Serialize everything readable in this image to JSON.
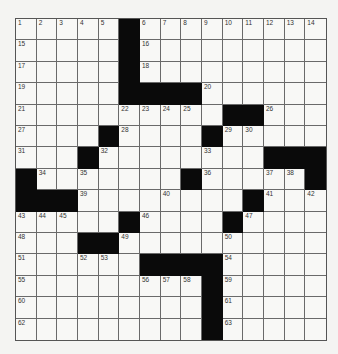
{
  "puzzle": {
    "rows": 15,
    "cols": 15,
    "colors": {
      "block": "#0a0a0a",
      "cell": "#f8f8f6",
      "line": "#6a6a6a",
      "background": "#f4f4f2"
    },
    "layout": [
      "#####.#########",
      "#####.#########",
      "#####.#########",
      "#####....######",
      "##########..###",
      "####.####.#####",
      "###.########...",
      ".#######.#####.",
      "...########.###",
      ".....#####.####",
      "###..##########",
      "######....#####",
      ".........######",
      ".........######",
      ".........######"
    ],
    "grid": [
      [
        1,
        2,
        3,
        4,
        5,
        null,
        6,
        7,
        8,
        9,
        10,
        11,
        12,
        13,
        14
      ],
      [
        15,
        0,
        0,
        0,
        0,
        null,
        16,
        0,
        0,
        0,
        0,
        0,
        0,
        0,
        0
      ],
      [
        17,
        0,
        0,
        0,
        0,
        null,
        18,
        0,
        0,
        0,
        0,
        0,
        0,
        0,
        0
      ],
      [
        19,
        0,
        0,
        0,
        0,
        null,
        null,
        null,
        null,
        20,
        0,
        0,
        0,
        0,
        0
      ],
      [
        21,
        0,
        0,
        0,
        0,
        22,
        23,
        24,
        25,
        0,
        null,
        null,
        26,
        0,
        0
      ],
      [
        27,
        0,
        0,
        0,
        null,
        28,
        0,
        0,
        0,
        null,
        29,
        30,
        0,
        0,
        0
      ],
      [
        31,
        0,
        0,
        null,
        32,
        0,
        0,
        0,
        0,
        33,
        0,
        0,
        null,
        null,
        null
      ],
      [
        null,
        34,
        0,
        35,
        0,
        0,
        0,
        0,
        null,
        36,
        0,
        0,
        37,
        38,
        null
      ],
      [
        null,
        null,
        null,
        39,
        0,
        0,
        0,
        40,
        0,
        0,
        0,
        null,
        41,
        0,
        42
      ],
      [
        43,
        44,
        45,
        0,
        0,
        null,
        46,
        0,
        0,
        0,
        null,
        47,
        0,
        0,
        0
      ],
      [
        48,
        0,
        0,
        null,
        null,
        49,
        0,
        0,
        0,
        0,
        50,
        0,
        0,
        0,
        0
      ],
      [
        51,
        0,
        0,
        52,
        53,
        0,
        null,
        null,
        null,
        null,
        54,
        0,
        0,
        0,
        0
      ],
      [
        55,
        0,
        0,
        0,
        0,
        0,
        56,
        57,
        58,
        null,
        59,
        0,
        0,
        0,
        0
      ],
      [
        60,
        0,
        0,
        0,
        0,
        0,
        0,
        0,
        0,
        null,
        61,
        0,
        0,
        0,
        0
      ],
      [
        62,
        0,
        0,
        0,
        0,
        0,
        0,
        0,
        0,
        null,
        63,
        0,
        0,
        0,
        0
      ]
    ]
  }
}
